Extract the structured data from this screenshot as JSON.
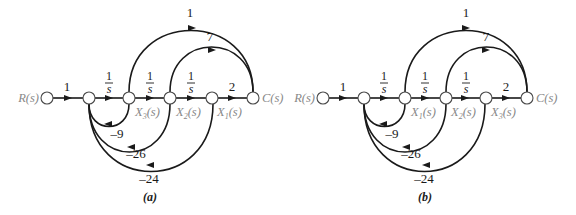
{
  "diagrams": [
    {
      "caption": "(a)",
      "input_label": "R(s)",
      "output_label": "C(s)",
      "forward_gains": [
        "1",
        "1/s",
        "1/s",
        "1/s",
        "2"
      ],
      "state_labels": [
        "X3(s)",
        "X2(s)",
        "X1(s)"
      ],
      "state_label_html": [
        [
          "X",
          "3",
          "(s)"
        ],
        [
          "X",
          "2",
          "(s)"
        ],
        [
          "X",
          "1",
          "(s)"
        ]
      ],
      "feedforward_gains": [
        "1",
        "7"
      ],
      "feedback_gains": [
        "-9",
        "-26",
        "-24"
      ],
      "frac": {
        "num": "1",
        "den": "s"
      }
    },
    {
      "caption": "(b)",
      "input_label": "R(s)",
      "output_label": "C(s)",
      "forward_gains": [
        "1",
        "1/s",
        "1/s",
        "1/s",
        "2"
      ],
      "state_labels": [
        "X1(s)",
        "X2(s)",
        "X3(s)"
      ],
      "state_label_html": [
        [
          "X",
          "1",
          "(s)"
        ],
        [
          "X",
          "2",
          "(s)"
        ],
        [
          "X",
          "3",
          "(s)"
        ]
      ],
      "feedforward_gains": [
        "1",
        "7"
      ],
      "feedback_gains": [
        "-9",
        "-26",
        "-24"
      ],
      "frac": {
        "num": "1",
        "den": "s"
      }
    }
  ]
}
